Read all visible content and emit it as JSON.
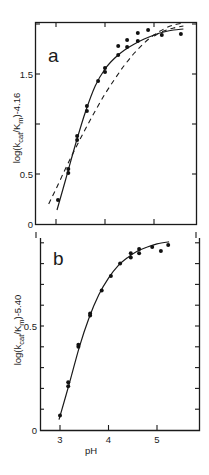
{
  "chart_data": [
    {
      "type": "scatter",
      "panel": "a",
      "panel_label": "a",
      "xlabel": "",
      "ylabel": "log(k_cat/K_m)-4.16",
      "ylabel_parts": {
        "pre": "log(k",
        "sub1": "cat",
        "mid": "/K",
        "sub2": "m",
        "post": ")-4.16"
      },
      "xlim": [
        2.6,
        5.9
      ],
      "ylim": [
        0,
        2.02
      ],
      "yticks": [
        0,
        0.5,
        1.0,
        1.5,
        2.0
      ],
      "ytick_labels": [
        "0",
        "0.5",
        "",
        "1.5",
        ""
      ],
      "xticks": [
        3,
        4,
        5
      ],
      "xtick_labels": [
        "",
        "",
        ""
      ],
      "grid": false,
      "points": [
        {
          "x": 3.04,
          "y": 0.24
        },
        {
          "x": 3.25,
          "y": 0.51
        },
        {
          "x": 3.25,
          "y": 0.55
        },
        {
          "x": 3.43,
          "y": 0.84
        },
        {
          "x": 3.43,
          "y": 0.88
        },
        {
          "x": 3.63,
          "y": 1.13
        },
        {
          "x": 3.63,
          "y": 1.18
        },
        {
          "x": 3.86,
          "y": 1.43
        },
        {
          "x": 4.0,
          "y": 1.52
        },
        {
          "x": 4.0,
          "y": 1.56
        },
        {
          "x": 4.27,
          "y": 1.69
        },
        {
          "x": 4.27,
          "y": 1.78
        },
        {
          "x": 4.45,
          "y": 1.77
        },
        {
          "x": 4.45,
          "y": 1.84
        },
        {
          "x": 4.67,
          "y": 1.83
        },
        {
          "x": 4.67,
          "y": 1.91
        },
        {
          "x": 4.88,
          "y": 1.94
        },
        {
          "x": 5.16,
          "y": 1.89
        },
        {
          "x": 5.55,
          "y": 1.9
        }
      ],
      "series": [
        {
          "name": "solid fit",
          "style": "solid",
          "x": [
            3.02,
            3.2,
            3.4,
            3.6,
            3.8,
            4.0,
            4.2,
            4.4,
            4.6,
            4.8,
            5.0,
            5.2,
            5.4,
            5.6
          ],
          "y": [
            0.14,
            0.45,
            0.8,
            1.12,
            1.38,
            1.55,
            1.66,
            1.74,
            1.8,
            1.85,
            1.89,
            1.92,
            1.94,
            1.95
          ]
        },
        {
          "name": "dashed curve (upper)",
          "style": "dashed",
          "x": [
            2.85,
            3.0,
            3.2,
            3.4,
            3.6,
            3.8,
            4.0,
            4.2,
            4.4,
            4.6,
            4.8,
            5.0,
            5.2,
            5.4,
            5.6
          ],
          "y": [
            0.2,
            0.35,
            0.56,
            0.76,
            0.95,
            1.13,
            1.3,
            1.45,
            1.59,
            1.71,
            1.81,
            1.89,
            1.95,
            1.99,
            2.01
          ]
        },
        {
          "name": "dashed curve (lower)",
          "style": "dashed",
          "x": [
            5.0,
            5.2,
            5.4,
            5.6
          ],
          "y": [
            1.88,
            1.93,
            1.96,
            1.98
          ]
        }
      ]
    },
    {
      "type": "scatter",
      "panel": "b",
      "panel_label": "b",
      "xlabel": "pH",
      "ylabel": "log(k_cat/K_m)-5.40",
      "ylabel_parts": {
        "pre": "log(k",
        "sub1": "cat",
        "mid": "/K",
        "sub2": "m",
        "post": ")-5.40"
      },
      "xlim": [
        2.6,
        5.9
      ],
      "ylim": [
        0,
        0.95
      ],
      "yticks": [
        0,
        0.1,
        0.2,
        0.3,
        0.4,
        0.5,
        0.6,
        0.7,
        0.8,
        0.9
      ],
      "ytick_labels": [
        "0",
        "",
        "",
        "",
        "",
        "0.5",
        "",
        "",
        "",
        ""
      ],
      "xticks": [
        3,
        4,
        5
      ],
      "xtick_labels": [
        "3",
        "4",
        "5"
      ],
      "grid": false,
      "points": [
        {
          "x": 3.0,
          "y": 0.07
        },
        {
          "x": 3.17,
          "y": 0.21
        },
        {
          "x": 3.17,
          "y": 0.23
        },
        {
          "x": 3.38,
          "y": 0.4
        },
        {
          "x": 3.38,
          "y": 0.41
        },
        {
          "x": 3.62,
          "y": 0.55
        },
        {
          "x": 3.62,
          "y": 0.56
        },
        {
          "x": 3.86,
          "y": 0.67
        },
        {
          "x": 4.05,
          "y": 0.74
        },
        {
          "x": 4.24,
          "y": 0.8
        },
        {
          "x": 4.46,
          "y": 0.83
        },
        {
          "x": 4.46,
          "y": 0.85
        },
        {
          "x": 4.63,
          "y": 0.85
        },
        {
          "x": 4.63,
          "y": 0.87
        },
        {
          "x": 4.9,
          "y": 0.88
        },
        {
          "x": 5.08,
          "y": 0.86
        },
        {
          "x": 5.23,
          "y": 0.89
        }
      ],
      "series": [
        {
          "name": "solid fit",
          "style": "solid",
          "x": [
            2.98,
            3.2,
            3.4,
            3.6,
            3.8,
            4.0,
            4.2,
            4.4,
            4.6,
            4.8,
            5.0,
            5.25
          ],
          "y": [
            0.05,
            0.23,
            0.4,
            0.54,
            0.65,
            0.73,
            0.79,
            0.83,
            0.86,
            0.88,
            0.895,
            0.905
          ]
        }
      ]
    }
  ]
}
